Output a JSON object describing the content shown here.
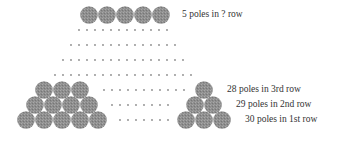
{
  "diagram": {
    "type": "stacked-poles-arithmetic-progression",
    "colors": {
      "pole_fill": "#8c8c8c",
      "pole_texture": "#a3a3a3",
      "dot": "#8a8a8a",
      "text": "#333333",
      "background": "#ffffff"
    },
    "labels": {
      "top_row": "5 poles in ? row",
      "row3": "28 poles in 3rd row",
      "row2": "29 poles in 2nd row",
      "row1": "30 poles in 1st row"
    },
    "rows": [
      {
        "name": "1st row",
        "poles": 30
      },
      {
        "name": "2nd row",
        "poles": 29
      },
      {
        "name": "3rd row",
        "poles": 28
      },
      {
        "name": "? row",
        "poles": 5
      }
    ],
    "icons": {
      "pole": "pole-end-circle-icon",
      "ellipsis": "ellipsis-dots-icon"
    }
  }
}
